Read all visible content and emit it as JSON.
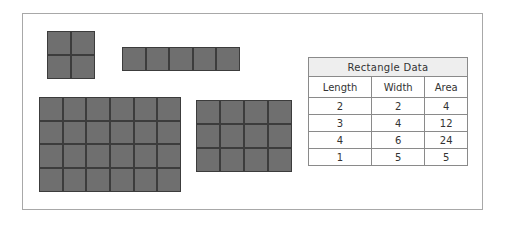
{
  "figure": {
    "shapes": [
      {
        "name": "square-2x2",
        "rows": 2,
        "cols": 2,
        "left": 47,
        "top": 31,
        "cell": 24
      },
      {
        "name": "strip-1x5",
        "rows": 1,
        "cols": 5,
        "left": 122,
        "top": 47,
        "cell": 23.6
      },
      {
        "name": "grid-4x6",
        "rows": 4,
        "cols": 6,
        "left": 39,
        "top": 97,
        "cell": 23.7
      },
      {
        "name": "grid-3x4",
        "rows": 3,
        "cols": 4,
        "left": 196,
        "top": 100,
        "cell": 24
      }
    ],
    "colors": {
      "cell_fill": "#6f6f6f",
      "cell_border": "#3c3c3c",
      "frame_border": "#a8a8a8"
    }
  },
  "table": {
    "title": "Rectangle Data",
    "headers": [
      "Length",
      "Width",
      "Area"
    ],
    "rows": [
      [
        "2",
        "2",
        "4"
      ],
      [
        "3",
        "4",
        "12"
      ],
      [
        "4",
        "6",
        "24"
      ],
      [
        "1",
        "5",
        "5"
      ]
    ]
  }
}
